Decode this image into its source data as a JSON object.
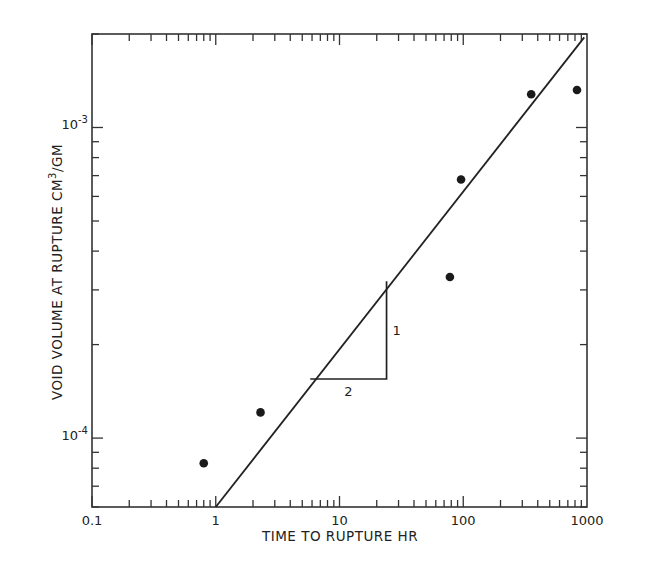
{
  "chart_data": {
    "type": "scatter",
    "title": "",
    "xlabel": "TIME TO RUPTURE HR",
    "ylabel": "VOID VOLUME AT RUPTURE CM3/GM",
    "ylabel_parts": {
      "pre": "VOID  VOLUME  AT  RUPTURE  CM",
      "sup": "3",
      "post": "/GM"
    },
    "x_scale": "log",
    "y_scale": "log",
    "xlim": [
      0.1,
      1000
    ],
    "ylim": [
      6e-05,
      0.002
    ],
    "x_ticks": [
      {
        "value": 0.1,
        "label": "0.1"
      },
      {
        "value": 1,
        "label": "1"
      },
      {
        "value": 10,
        "label": "10"
      },
      {
        "value": 100,
        "label": "100"
      },
      {
        "value": 1000,
        "label": "1000"
      }
    ],
    "y_ticks": [
      {
        "value": 0.0001,
        "label_base": "10",
        "label_exp": "-4"
      },
      {
        "value": 0.001,
        "label_base": "10",
        "label_exp": "-3"
      }
    ],
    "grid": false,
    "legend": null,
    "series": [
      {
        "name": "data",
        "marker": "filled-circle",
        "x": [
          0.8,
          2.3,
          78,
          96,
          354,
          830
        ],
        "y": [
          8.3e-05,
          0.000121,
          0.00033,
          0.00068,
          0.00128,
          0.00132
        ]
      },
      {
        "name": "fit line (slope 1/2)",
        "type": "line",
        "x": [
          1,
          950
        ],
        "y": [
          6e-05,
          0.00195
        ]
      }
    ],
    "annotations": [
      {
        "type": "slope-triangle",
        "x_range": [
          5.8,
          24
        ],
        "y_range": [
          0.000155,
          0.00032
        ],
        "run_label": "2",
        "rise_label": "1"
      }
    ]
  }
}
